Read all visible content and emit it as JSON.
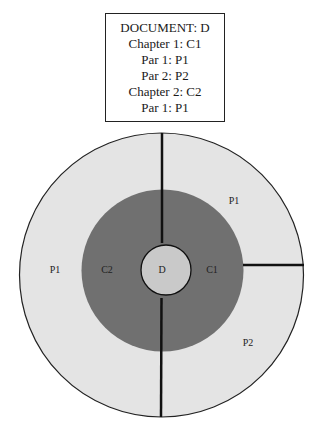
{
  "legend": {
    "lines": [
      "DOCUMENT: D",
      "Chapter 1: C1",
      "Par 1: P1",
      "Par 2: P2",
      "Chapter 2: C2",
      "Par 1: P1"
    ]
  },
  "diagram": {
    "colors": {
      "outer_ring": "#e4e4e4",
      "middle_ring": "#707070",
      "center": "#c9c9c9",
      "stroke": "#111111"
    },
    "labels": {
      "center": "D",
      "chapter_1": "C1",
      "chapter_2": "C2",
      "ch1_par_1": "P1",
      "ch1_par_2": "P2",
      "ch2_par_1": "P1"
    }
  }
}
